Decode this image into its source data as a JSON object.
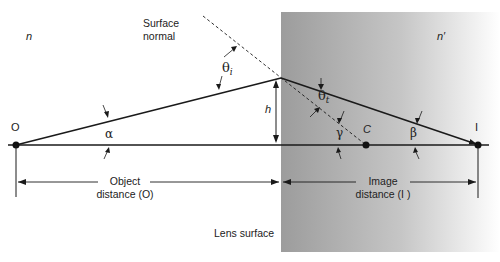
{
  "diagram": {
    "media": {
      "left_index": "n",
      "right_index": "n′"
    },
    "labels": {
      "surface_normal_line1": "Surface",
      "surface_normal_line2": "normal",
      "lens_surface": "Lens surface",
      "object_point": "O",
      "image_point": "I",
      "center_of_curvature": "C",
      "height": "h",
      "object_distance_line1": "Object",
      "object_distance_line2": "distance (O)",
      "image_distance_line1": "Image",
      "image_distance_line2": "distance (I )"
    },
    "angles": {
      "incidence": "θ",
      "incidence_sub": "i",
      "transmission": "θ",
      "transmission_sub": "t",
      "alpha": "α",
      "beta": "β",
      "gamma": "γ"
    },
    "colors": {
      "line": "#1a1a1a",
      "shade_dark": "#9a9a9a",
      "shade_light": "#ffffff"
    }
  }
}
